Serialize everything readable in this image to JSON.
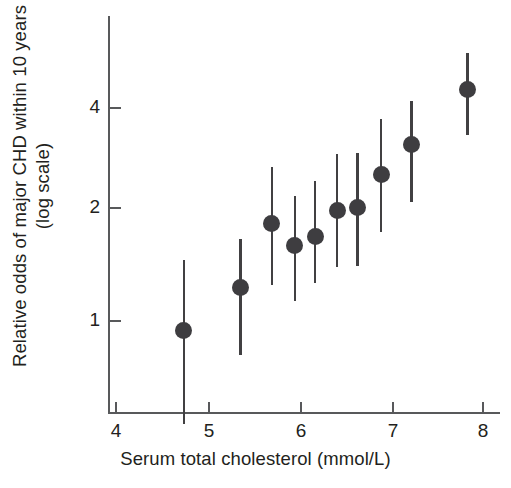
{
  "chart_data": {
    "type": "scatter",
    "title": "",
    "xlabel": "Serum total cholesterol (mmol/L)",
    "ylabel": "Relative odds of major CHD within 10 years (log scale)",
    "ylabel_line1": "Relative odds of major CHD within 10 years",
    "ylabel_line2": "(log scale)",
    "yscale": "log",
    "xlim": [
      3.7,
      8.25
    ],
    "ylim": [
      0.42,
      6.2
    ],
    "xticks": [
      4,
      5,
      6,
      7,
      8
    ],
    "xticklabels": [
      "4",
      "5",
      "6",
      "7",
      "8"
    ],
    "yticks": [
      1,
      2,
      4
    ],
    "yticklabels": [
      "1",
      "2",
      "4"
    ],
    "grid": false,
    "legend": "none",
    "marker_color": "#3e3d40",
    "errorbar_color": "#414042",
    "axis_color": "#58595b",
    "text_color": "#231f20",
    "series": [
      {
        "name": "Relative odds of major CHD within 10 years",
        "x": [
          4.75,
          5.37,
          5.71,
          5.96,
          6.18,
          6.42,
          6.64,
          6.9,
          7.23,
          7.84
        ],
        "y": [
          0.94,
          1.24,
          1.89,
          1.63,
          1.73,
          2.05,
          2.09,
          2.6,
          3.15,
          4.52
        ],
        "ci_low": [
          0.51,
          0.8,
          1.26,
          1.14,
          1.28,
          1.42,
          1.43,
          1.79,
          2.17,
          3.35
        ],
        "ci_high": [
          1.49,
          1.7,
          2.73,
          2.25,
          2.48,
          2.97,
          2.98,
          3.73,
          4.18,
          5.72
        ]
      }
    ]
  },
  "axes": {
    "x_tick_px": [
      115,
      208,
      300,
      392,
      482
    ],
    "y_tick_px": [
      321,
      208,
      108
    ],
    "y_axis_top_px": 16,
    "y_axis_bottom_px": 412,
    "x_axis_y_px": 412,
    "x_axis_left_px": 108,
    "x_axis_right_px": 500
  }
}
